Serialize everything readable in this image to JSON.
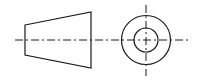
{
  "diagram": {
    "type": "projection-symbol",
    "stroke_color": "#1a1a1a",
    "background": "#ffffff",
    "frustum_side_view": {
      "points": [
        [
          25,
          25
        ],
        [
          91,
          12
        ],
        [
          91,
          68
        ],
        [
          25,
          55
        ]
      ]
    },
    "end_view": {
      "center": [
        146,
        40
      ],
      "outer_radius": 24.5,
      "inner_radius": 12
    },
    "centerlines": {
      "horizontal": {
        "x1": 15,
        "x2": 191,
        "y": 40
      },
      "vertical": {
        "x": 146,
        "y1": 5,
        "y2": 76
      }
    }
  }
}
